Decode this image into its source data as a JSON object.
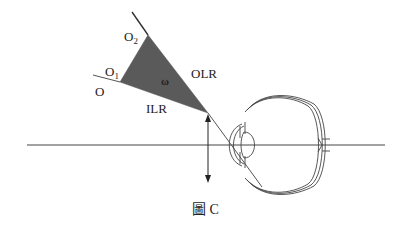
{
  "figure": {
    "caption": "圖 C",
    "labels": {
      "o2": "O",
      "o2_sub": "2",
      "o1": "O",
      "o1_sub": "1",
      "o": "O",
      "omega": "ω",
      "olr": "OLR",
      "ilr": "ILR"
    },
    "colors": {
      "triangle_fill": "#5a5a5a",
      "line": "#3a3a3a",
      "background": "#ffffff"
    }
  }
}
